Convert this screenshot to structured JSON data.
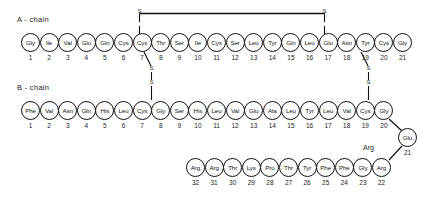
{
  "diagram": {
    "background_color": "#ffffff",
    "stroke_color": "#111111"
  },
  "a_chain": {
    "label": "A - chain",
    "residues": [
      {
        "name": "Gly",
        "num": "1"
      },
      {
        "name": "Ile",
        "num": "2"
      },
      {
        "name": "Val",
        "num": "3"
      },
      {
        "name": "Glu",
        "num": "4"
      },
      {
        "name": "Gln",
        "num": "5"
      },
      {
        "name": "Cys",
        "num": "6"
      },
      {
        "name": "Cys",
        "num": "7"
      },
      {
        "name": "Thr",
        "num": "8"
      },
      {
        "name": "Ser",
        "num": "9"
      },
      {
        "name": "Ile",
        "num": "10"
      },
      {
        "name": "Cys",
        "num": "11"
      },
      {
        "name": "Ser",
        "num": "12"
      },
      {
        "name": "Leu",
        "num": "13"
      },
      {
        "name": "Tyr",
        "num": "14"
      },
      {
        "name": "Gln",
        "num": "15"
      },
      {
        "name": "Leu",
        "num": "16"
      },
      {
        "name": "Glu",
        "num": "17"
      },
      {
        "name": "Asn",
        "num": "18"
      },
      {
        "name": "Tyr",
        "num": "19"
      },
      {
        "name": "Cys",
        "num": "20"
      },
      {
        "name": "Gly",
        "num": "21"
      }
    ]
  },
  "b_chain": {
    "label": "B - chain",
    "residues_top": [
      {
        "name": "Phe",
        "num": "1"
      },
      {
        "name": "Val",
        "num": "2"
      },
      {
        "name": "Asn",
        "num": "3"
      },
      {
        "name": "Gln",
        "num": "4"
      },
      {
        "name": "His",
        "num": "5"
      },
      {
        "name": "Leu",
        "num": "6"
      },
      {
        "name": "Cys",
        "num": "7"
      },
      {
        "name": "Gly",
        "num": "8"
      },
      {
        "name": "Ser",
        "num": "9"
      },
      {
        "name": "His",
        "num": "10"
      },
      {
        "name": "Leu",
        "num": "11"
      },
      {
        "name": "Val",
        "num": "12"
      },
      {
        "name": "Glu",
        "num": "13"
      },
      {
        "name": "Ala",
        "num": "14"
      },
      {
        "name": "Leu",
        "num": "15"
      },
      {
        "name": "Tyr",
        "num": "16"
      },
      {
        "name": "Leu",
        "num": "17"
      },
      {
        "name": "Val",
        "num": "18"
      },
      {
        "name": "Cys",
        "num": "19"
      },
      {
        "name": "Gly",
        "num": "20"
      }
    ],
    "corner_residue": {
      "name": "Glu",
      "num": "21"
    },
    "annotation": "Arg",
    "residues_bottom": [
      {
        "name": "Arg",
        "num": "22"
      },
      {
        "name": "Gly",
        "num": "23"
      },
      {
        "name": "Phe",
        "num": "24"
      },
      {
        "name": "Phe",
        "num": "25"
      },
      {
        "name": "Tyr",
        "num": "26"
      },
      {
        "name": "Thr",
        "num": "27"
      },
      {
        "name": "Pro",
        "num": "28"
      },
      {
        "name": "Lys",
        "num": "29"
      },
      {
        "name": "Thr",
        "num": "30"
      },
      {
        "name": "Arg",
        "num": "31"
      },
      {
        "name": "Arg",
        "num": "32"
      }
    ]
  },
  "disulfide_bonds": [
    {
      "id": "A6-A11",
      "label_left": "S",
      "label_right": "S",
      "type": "intrachain"
    },
    {
      "id": "A7-B7",
      "label_top": "S",
      "label_bottom": "S",
      "type": "interchain"
    },
    {
      "id": "A20-B19",
      "label_top": "S",
      "label_bottom": "S",
      "type": "interchain"
    }
  ]
}
